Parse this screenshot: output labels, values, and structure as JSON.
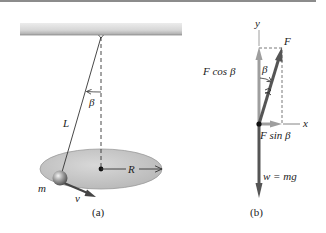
{
  "figure": {
    "panel_a": {
      "caption": "(a)",
      "labels": {
        "beta": "β",
        "length": "L",
        "radius": "R",
        "mass": "m",
        "velocity": "v"
      }
    },
    "panel_b": {
      "caption": "(b)",
      "labels": {
        "y_axis": "y",
        "x_axis": "x",
        "force": "F",
        "beta": "β",
        "f_cos_beta": "F cos β",
        "f_sin_beta": "F sin β",
        "weight": "w = mg"
      }
    },
    "colors": {
      "ceiling_top": "#e6e6e6",
      "ceiling_bottom": "#b8b8b8",
      "ellipse_fill": "#c9c9c9",
      "ellipse_stroke": "#9a9a9a",
      "component_arrow": "#9e9e9e",
      "main_arrow": "#555555",
      "dark_line": "#333333",
      "top_border": "#8c8c8c"
    }
  }
}
